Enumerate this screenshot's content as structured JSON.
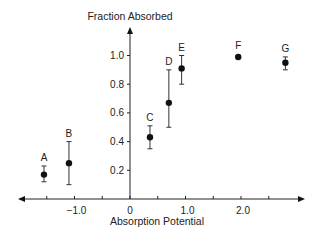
{
  "chart_data": {
    "type": "scatter",
    "title": "",
    "xlabel": "Absorption Potential",
    "ylabel": "Fraction Absorbed",
    "xlim": [
      -2.0,
      3.0
    ],
    "ylim": [
      0,
      1.15
    ],
    "x_ticks": [
      -1.0,
      0,
      1.0,
      2.0
    ],
    "x_tick_labels": [
      "−1.0",
      "0",
      "1.0",
      "2.0"
    ],
    "x_minor_ticks": [
      -1.5,
      -0.5,
      0.5,
      1.5,
      2.5
    ],
    "y_ticks": [
      0.2,
      0.4,
      0.6,
      0.8,
      1.0
    ],
    "y_tick_labels": [
      "0.2",
      "0.4",
      "0.6",
      "0.8",
      "1.0"
    ],
    "grid": false,
    "legend": "none",
    "points": [
      {
        "label": "A",
        "x": -1.55,
        "y": 0.17,
        "err_low": 0.12,
        "err_high": 0.23
      },
      {
        "label": "B",
        "x": -1.1,
        "y": 0.25,
        "err_low": 0.1,
        "err_high": 0.4
      },
      {
        "label": "C",
        "x": 0.36,
        "y": 0.43,
        "err_low": 0.35,
        "err_high": 0.51
      },
      {
        "label": "D",
        "x": 0.7,
        "y": 0.67,
        "err_low": 0.5,
        "err_high": 0.9
      },
      {
        "label": "E",
        "x": 0.93,
        "y": 0.91,
        "err_low": 0.8,
        "err_high": 1.0
      },
      {
        "label": "F",
        "x": 1.95,
        "y": 0.99,
        "err_low": null,
        "err_high": null
      },
      {
        "label": "G",
        "x": 2.8,
        "y": 0.95,
        "err_low": 0.9,
        "err_high": 0.99
      }
    ]
  }
}
